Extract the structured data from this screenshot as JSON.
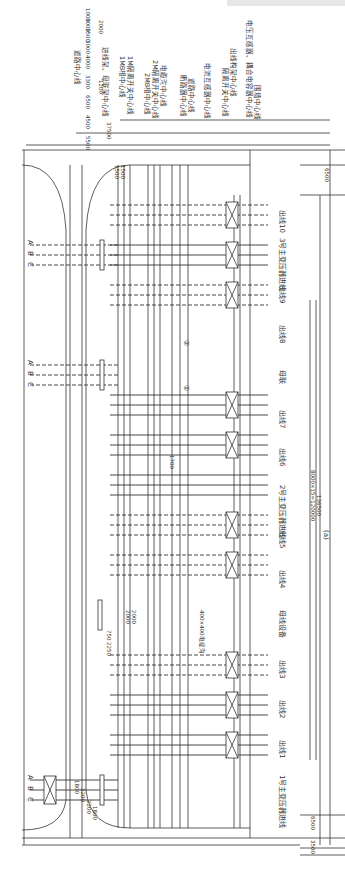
{
  "figure_label": "(a)",
  "orientation": "rotated 90° clockwise",
  "centerlines": [
    {
      "label": "道路中心线"
    },
    {
      "label": "进线架、母联架中心线"
    },
    {
      "label": "1MB相中心线"
    },
    {
      "label": "1M隔离开关中心线"
    },
    {
      "label": "2MB相中心线"
    },
    {
      "label": "2M隔离开关中心线"
    },
    {
      "label": "电缆沟中心线"
    },
    {
      "label": "断路器中心线"
    },
    {
      "label": "道路中心线 "
    },
    {
      "label": "电流互感器中心线"
    },
    {
      "label": "隔离开关中心线"
    },
    {
      "label": "出线构架中心线"
    },
    {
      "label": "电压互感器、耦合电容器中心线"
    },
    {
      "label": "围墙中心线"
    }
  ],
  "dimensions_top": [
    "5500",
    "4500",
    "6500",
    "3300",
    "1200",
    "4000",
    "3000",
    "3500",
    "3000",
    "2000",
    "1000",
    "3000"
  ],
  "dimension_total_top": "37500",
  "dimensions_bay": [
    "1500",
    "1500",
    "1500",
    "1500"
  ],
  "dimensions_right": [
    "6500",
    "3500",
    "6500"
  ],
  "dimension_bays": "8000×15=120000",
  "dimension_total_length": "136500",
  "dimensions_left": [
    "1800",
    "2200",
    "2200",
    "1800"
  ],
  "dimension_mid": [
    "2000",
    "2000",
    "750",
    "2250"
  ],
  "dimension_cable": "1700",
  "cable_trench_label": "400×400电缆沟",
  "phase_labels": [
    "A",
    "B",
    "C"
  ],
  "bays": [
    {
      "id": "tx1",
      "label": "1号主变压器进线"
    },
    {
      "id": "out1",
      "label": "出线1"
    },
    {
      "id": "out2",
      "label": "出线2"
    },
    {
      "id": "out3",
      "label": "出线3"
    },
    {
      "id": "busdev",
      "label": "母线设备"
    },
    {
      "id": "out4",
      "label": "出线4"
    },
    {
      "id": "out5",
      "label": "出线5"
    },
    {
      "id": "tx2",
      "label": "2号主变压器进线"
    },
    {
      "id": "out6",
      "label": "出线6"
    },
    {
      "id": "out7",
      "label": "出线7"
    },
    {
      "id": "coupler",
      "label": "母联"
    },
    {
      "id": "out8",
      "label": "出线8"
    },
    {
      "id": "out9",
      "label": "出线9"
    },
    {
      "id": "tx3",
      "label": "3号主变压器进线"
    },
    {
      "id": "out10",
      "label": "出线10"
    }
  ],
  "markers": [
    "①",
    "②"
  ],
  "colors": {
    "line": "#333333",
    "dash": "#555555",
    "bg": "#ffffff"
  }
}
